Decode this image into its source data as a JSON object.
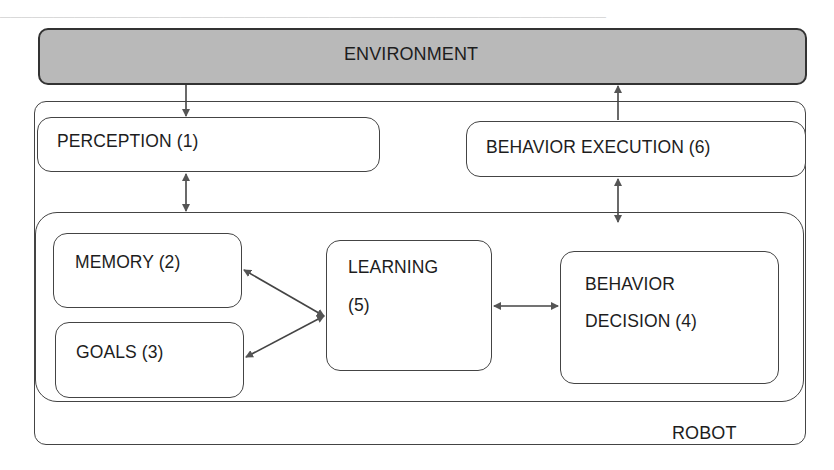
{
  "diagram": {
    "environment": {
      "label": "ENVIRONMENT",
      "fill_color": "#b9b9b9"
    },
    "robot": {
      "label": "ROBOT"
    },
    "modules": [
      {
        "id": "perception",
        "label": "PERCEPTION (1)"
      },
      {
        "id": "memory",
        "label": "MEMORY (2)"
      },
      {
        "id": "goals",
        "label": "GOALS (3)"
      },
      {
        "id": "behavior_decision",
        "label_line1": "BEHAVIOR",
        "label_line2": "DECISION (4)"
      },
      {
        "id": "learning",
        "label_line1": "LEARNING",
        "label_line2": "(5)"
      },
      {
        "id": "behavior_execution",
        "label": "BEHAVIOR EXECUTION (6)"
      }
    ],
    "connections": [
      {
        "from": "environment",
        "to": "perception",
        "direction": "one-way"
      },
      {
        "from": "perception",
        "to": "inner-core",
        "direction": "two-way"
      },
      {
        "from": "memory",
        "to": "learning",
        "direction": "two-way"
      },
      {
        "from": "goals",
        "to": "learning",
        "direction": "two-way"
      },
      {
        "from": "learning",
        "to": "behavior_decision",
        "direction": "two-way"
      },
      {
        "from": "inner-core",
        "to": "behavior_execution",
        "direction": "two-way"
      },
      {
        "from": "behavior_execution",
        "to": "environment",
        "direction": "one-way"
      }
    ]
  }
}
